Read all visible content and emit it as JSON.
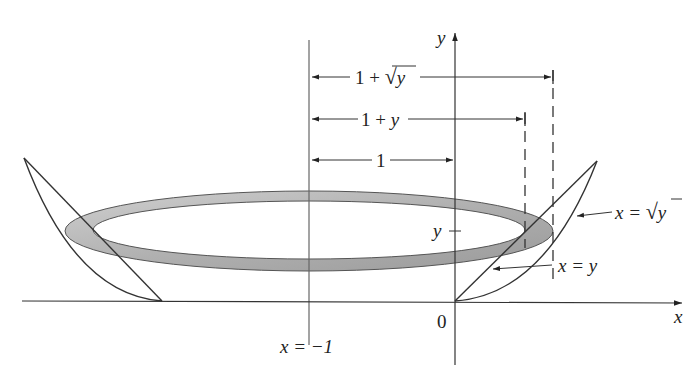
{
  "diagram": {
    "axes": {
      "x_label": "x",
      "y_label": "y",
      "origin_label": "0"
    },
    "axis_of_rotation_label": "x = −1",
    "y_tick_label": "y",
    "dimension_labels": {
      "outer_radius": "1 + √y",
      "outer_radius_prefix": "1 + ",
      "outer_radius_var": "y",
      "inner_radius": "1 + y",
      "inner_radius_prefix": "1 + ",
      "inner_radius_var": "y",
      "unit": "1"
    },
    "curve_labels": {
      "sqrt_curve": "x = √y",
      "sqrt_curve_lhs": "x = ",
      "sqrt_curve_var": "y",
      "line_curve": "x = y",
      "line_curve_lhs": "x = ",
      "line_curve_var": "y"
    },
    "colors": {
      "washer_fill": "#a9a9a9",
      "washer_fill_light": "#d4d4d4",
      "line": "#333333"
    }
  }
}
